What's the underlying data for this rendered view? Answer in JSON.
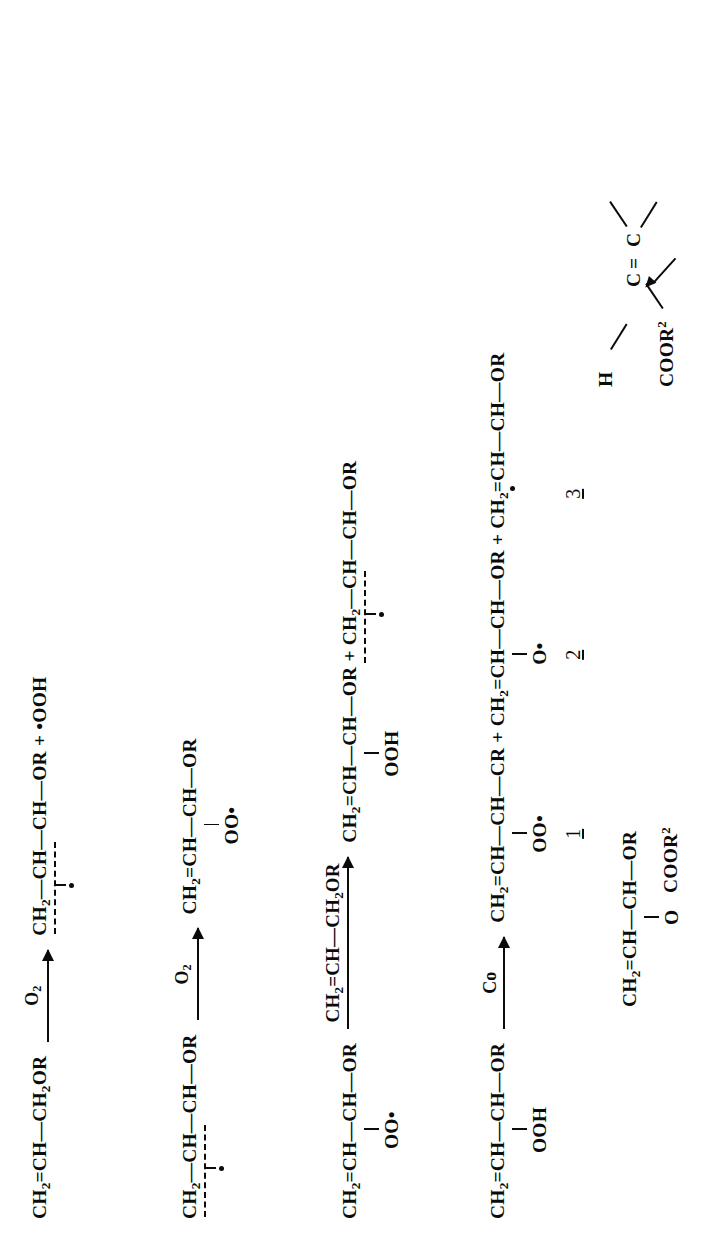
{
  "document": {
    "kind": "scanned-reaction-scheme-page",
    "orientation": "rotated-90-ccw",
    "background_color": "#ffffff",
    "ink_color": "#0b0b0b"
  },
  "reactions": [
    {
      "id": "reaction-1",
      "reactant": "CH2=CH—CH2OR",
      "reactant_parts": {
        "head": "CH",
        "head_sub": "2",
        "eq": "=CH",
        "dash": "—CH",
        "tail_sub": "2",
        "tail": "OR"
      },
      "arrow_label": "O2",
      "arrow_label_main": "O",
      "arrow_label_sub": "2",
      "product": "CH2—CH—CH—OR + •OOH",
      "product_parts": {
        "a": "CH",
        "a_sub": "2",
        "b": "—CH—CH—OR",
        "plus": "+",
        "c": "•OOH"
      },
      "has_dashed_delocalisation": true,
      "radical_dot_below": true
    },
    {
      "id": "reaction-2",
      "reactant": "CH2—CH—CH—OR",
      "reactant_parts": {
        "a": "CH",
        "a_sub": "2",
        "b": "—CH—CH—OR"
      },
      "has_dashed_delocalisation": true,
      "radical_dot_below": true,
      "arrow_label": "O2",
      "arrow_label_main": "O",
      "arrow_label_sub": "2",
      "product": "CH2=CH—CH—OR",
      "product_parts": {
        "a": "CH",
        "a_sub": "2",
        "b": "=CH—CH—OR"
      },
      "product_substituent": "OO•"
    },
    {
      "id": "reaction-3",
      "reactant": "CH2=CH—CH—OR",
      "reactant_parts": {
        "a": "CH",
        "a_sub": "2",
        "b": "=CH—CH—OR"
      },
      "reactant_substituent": "OO•",
      "arrow_label": "CH2=CH—CH2OR",
      "arrow_label_parts": {
        "a": "CH",
        "a_sub": "2",
        "b": "=CH—CH",
        "c_sub": "2",
        "c": "OR"
      },
      "product": "CH2=CH—CH—OR + CH2—CH—CH—OR",
      "product_parts": {
        "p1_a": "CH",
        "p1_a_sub": "2",
        "p1_b": "=CH—CH—OR",
        "plus": "+",
        "p2_a": "CH",
        "p2_a_sub": "2",
        "p2_b": "—CH—CH—OR"
      },
      "product_substituent": "OOH",
      "product2_has_dashed": true,
      "product2_radical_dot": true
    },
    {
      "id": "reaction-4",
      "reactant": "CH2=CH—CH—OR",
      "reactant_parts": {
        "a": "CH",
        "a_sub": "2",
        "b": "=CH—CH—OR"
      },
      "reactant_substituent": "OOH",
      "arrow_label": "Co",
      "product": "CH2=CH—CH—CR + CH2=CH—CH—OR + CH2=CH—CH—OR",
      "product_parts": {
        "p1_a": "CH",
        "p1_a_sub": "2",
        "p1_b": "=CH—CH—CR",
        "p1_substituent": "OO•",
        "p1_number": "1",
        "plus1": "+",
        "p2_a": "CH",
        "p2_a_sub": "2",
        "p2_b": "=CH—CH—OR",
        "p2_substituent": "O•",
        "p2_number": "2",
        "plus2": "+",
        "p3_a": "CH",
        "p3_a_sub": "2",
        "p3_b": "=CH—CH—OR",
        "p3_radical_dot": true,
        "p3_number": "3"
      }
    }
  ],
  "compound_numbers": [
    "1",
    "2",
    "3"
  ],
  "bottom_structures": {
    "left_species": {
      "chain_a": "CH",
      "chain_a_sub": "2",
      "chain_b": "=CH—CH—OR",
      "substituent_o": "O",
      "substituent_ester": "COOR",
      "substituent_ester_sup": "2"
    },
    "alkene_fragment": {
      "h_label": "H",
      "ester_label": "COOR",
      "ester_label_sup": "2",
      "c_left": "C",
      "c_right": "C",
      "double_bond": "=",
      "number": "2"
    }
  }
}
